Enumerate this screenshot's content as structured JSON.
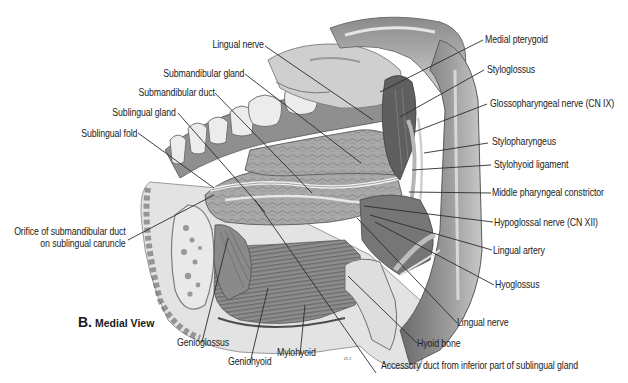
{
  "figure": {
    "caption_letter": "B.",
    "caption_view": "Medial View",
    "style": {
      "line_color": "#2b2b2b",
      "text_color": "#222222",
      "background": "#ffffff"
    }
  },
  "labels": {
    "lingual_nerve_top": "Lingual nerve",
    "submandibular_gland": "Submandibular gland",
    "submandibular_duct": "Submandibular duct",
    "sublingual_gland": "Sublingual gland",
    "sublingual_fold": "Sublingual fold",
    "orifice_line1": "Orifice of submandibular duct",
    "orifice_line2": "on sublingual caruncle",
    "genioglossus": "Genioglossus",
    "geniohyoid": "Geniohyoid",
    "mylohyoid": "Mylohyoid",
    "accessory_duct": "Accessory duct from inferior part of sublingual gland",
    "hyoid_bone": "Hyoid bone",
    "lingual_nerve_bottom": "Lingual nerve",
    "hyoglossus": "Hyoglossus",
    "lingual_artery": "Lingual artery",
    "hypoglossal_nerve": "Hypoglossal nerve (CN XII)",
    "middle_pharyngeal_constrictor": "Middle pharyngeal constrictor",
    "stylohyoid_ligament": "Stylohyoid ligament",
    "stylopharyngeus": "Stylopharyngeus",
    "glossopharyngeal_nerve": "Glossopharyngeal nerve (CN IX)",
    "styloglossus": "Styloglossus",
    "medial_pterygoid": "Medial pterygoid"
  }
}
